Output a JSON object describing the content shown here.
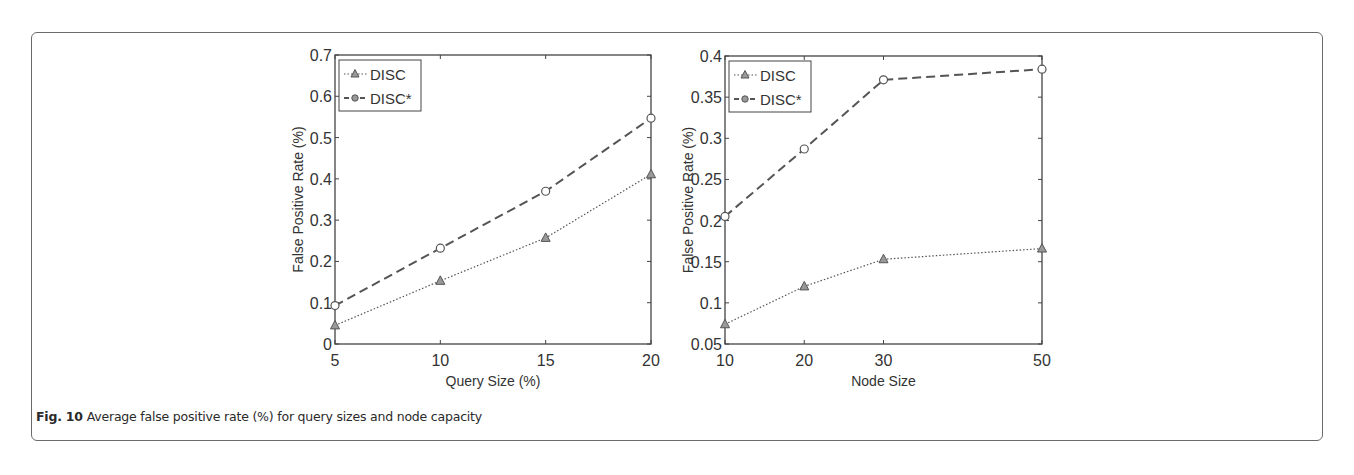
{
  "caption": {
    "label": "Fig. 10",
    "text": " Average false positive rate (%) for query sizes and node capacity"
  },
  "colors": {
    "frame": "#6a6a6a",
    "series_line": "#555555",
    "axis": "#444444"
  },
  "chart_data": [
    {
      "type": "line",
      "title": "",
      "xlabel": "Query Size (%)",
      "ylabel": "False Positive Rate (%)",
      "x": [
        5,
        10,
        15,
        20
      ],
      "xticks": [
        "5",
        "10",
        "15",
        "20"
      ],
      "yticks": [
        "0",
        "0.1",
        "0.2",
        "0.3",
        "0.4",
        "0.5",
        "0.6",
        "0.7"
      ],
      "xlim": [
        5,
        20
      ],
      "ylim": [
        0,
        0.7
      ],
      "grid": false,
      "legend_position": "upper left",
      "series": [
        {
          "name": "DISC",
          "marker": "triangle",
          "linestyle": "dotted",
          "values": [
            0.045,
            0.153,
            0.257,
            0.411
          ]
        },
        {
          "name": "DISC*",
          "marker": "circle",
          "linestyle": "dashed",
          "values": [
            0.093,
            0.232,
            0.37,
            0.547
          ]
        }
      ]
    },
    {
      "type": "line",
      "title": "",
      "xlabel": "Node Size",
      "ylabel": "False Positive Rate (%)",
      "x": [
        10,
        20,
        30,
        50
      ],
      "xticks": [
        "10",
        "20",
        "30",
        "50"
      ],
      "yticks": [
        "0.05",
        "0.1",
        "0.15",
        "0.2",
        "0.25",
        "0.3",
        "0.35",
        "0.4"
      ],
      "xlim": [
        10,
        50
      ],
      "ylim": [
        0.05,
        0.4
      ],
      "grid": false,
      "legend_position": "upper left",
      "series": [
        {
          "name": "DISC",
          "marker": "triangle",
          "linestyle": "dotted",
          "values": [
            0.074,
            0.12,
            0.153,
            0.166
          ]
        },
        {
          "name": "DISC*",
          "marker": "circle",
          "linestyle": "dashed",
          "values": [
            0.205,
            0.287,
            0.371,
            0.384
          ]
        }
      ]
    }
  ]
}
